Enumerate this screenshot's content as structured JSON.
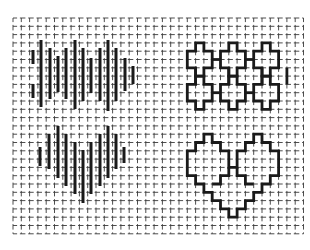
{
  "diagram": {
    "type": "needlework stitch chart on graph paper",
    "background": "#ffffff",
    "ink_color": "#1a1a1a",
    "grid": {
      "origin_x": 13,
      "origin_y": 18,
      "pitch": 8.3,
      "columns": 35,
      "rows": 26,
      "line_color": "#3a3a3a"
    },
    "panels": [
      {
        "id": "left",
        "label": "straight-stitch fill",
        "motifs": [
          {
            "name": "wave-band",
            "style": "vertical stitch bars",
            "stitches": [
              {
                "x": 33,
                "y1": 50,
                "y2": 64
              },
              {
                "x": 33,
                "y1": 84,
                "y2": 98
              },
              {
                "x": 41,
                "y1": 40,
                "y2": 107
              },
              {
                "x": 50,
                "y1": 48,
                "y2": 99
              },
              {
                "x": 58,
                "y1": 56,
                "y2": 92
              },
              {
                "x": 66,
                "y1": 48,
                "y2": 99
              },
              {
                "x": 75,
                "y1": 40,
                "y2": 109
              },
              {
                "x": 83,
                "y1": 48,
                "y2": 101
              },
              {
                "x": 91,
                "y1": 58,
                "y2": 93
              },
              {
                "x": 100,
                "y1": 48,
                "y2": 101
              },
              {
                "x": 108,
                "y1": 40,
                "y2": 111
              },
              {
                "x": 116,
                "y1": 48,
                "y2": 101
              },
              {
                "x": 125,
                "y1": 58,
                "y2": 91
              },
              {
                "x": 133,
                "y1": 66,
                "y2": 84
              }
            ]
          },
          {
            "name": "heart",
            "style": "vertical stitch bars",
            "stitches": [
              {
                "x": 40,
                "y1": 147,
                "y2": 166
              },
              {
                "x": 49,
                "y1": 134,
                "y2": 169
              },
              {
                "x": 58,
                "y1": 126,
                "y2": 178
              },
              {
                "x": 66,
                "y1": 134,
                "y2": 186
              },
              {
                "x": 75,
                "y1": 142,
                "y2": 194
              },
              {
                "x": 83,
                "y1": 150,
                "y2": 203
              },
              {
                "x": 91,
                "y1": 142,
                "y2": 194
              },
              {
                "x": 100,
                "y1": 134,
                "y2": 186
              },
              {
                "x": 108,
                "y1": 126,
                "y2": 178
              },
              {
                "x": 116,
                "y1": 134,
                "y2": 169
              },
              {
                "x": 124,
                "y1": 147,
                "y2": 163
              }
            ]
          }
        ]
      },
      {
        "id": "right",
        "label": "outline chart",
        "motifs": [
          {
            "name": "cross-lattice",
            "style": "stepped outline",
            "rows": 2,
            "columns": 3
          },
          {
            "name": "heart-outline",
            "style": "stepped outline"
          }
        ]
      }
    ]
  }
}
